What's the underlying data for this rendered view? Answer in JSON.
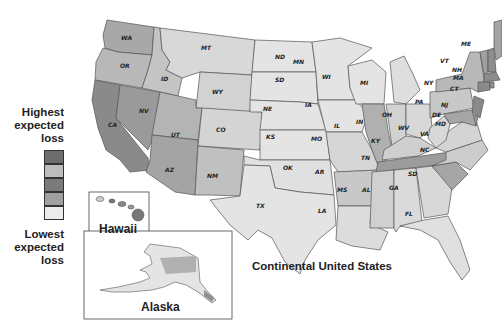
{
  "map": {
    "title": "Continental United States",
    "type": "choropleth",
    "geography": "US counties",
    "color_scheme": "grayscale"
  },
  "legend": {
    "top_label": "Highest expected loss",
    "top_label_lines": [
      "Highest",
      "expected",
      "loss"
    ],
    "bottom_label": "Lowest expected loss",
    "bottom_label_lines": [
      "Lowest",
      "expected",
      "loss"
    ],
    "classes": [
      {
        "rank": 1,
        "label": "Highest",
        "color": "#6e6e6e"
      },
      {
        "rank": 2,
        "label": "",
        "color": "#bdbdbd"
      },
      {
        "rank": 3,
        "label": "",
        "color": "#7a7a7a"
      },
      {
        "rank": 4,
        "label": "",
        "color": "#a0a0a0"
      },
      {
        "rank": 5,
        "label": "Lowest",
        "color": "#ececec"
      }
    ]
  },
  "insets": {
    "hawaii": {
      "label": "Hawaii"
    },
    "alaska": {
      "label": "Alaska"
    }
  },
  "states": [
    "WA",
    "OR",
    "CA",
    "NV",
    "ID",
    "MT",
    "WY",
    "UT",
    "AZ",
    "CO",
    "NM",
    "ND",
    "SD",
    "NE",
    "KS",
    "OK",
    "TX",
    "MN",
    "IA",
    "MO",
    "AR",
    "LA",
    "WI",
    "IL",
    "MI",
    "IN",
    "OH",
    "KY",
    "TN",
    "MS",
    "AL",
    "GA",
    "FL",
    "SC",
    "NC",
    "VA",
    "WV",
    "PA",
    "NY",
    "VT",
    "NH",
    "ME",
    "MA",
    "CT",
    "RI",
    "NJ",
    "DE",
    "MD"
  ],
  "colors": {
    "state_border": "#555555",
    "land_low": "#ececec",
    "water": "#ffffff"
  }
}
